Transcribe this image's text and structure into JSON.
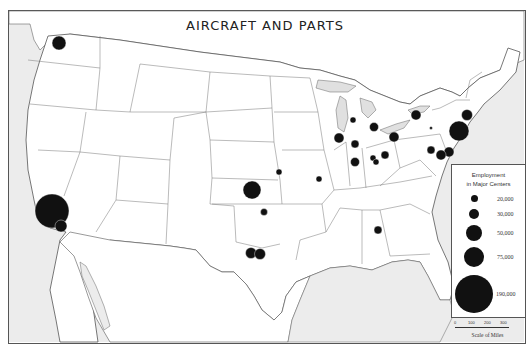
{
  "title": "AIRCRAFT AND PARTS",
  "legend": {
    "title_line1": "Employment",
    "title_line2": "in Major Centers",
    "items": [
      {
        "label": "20,000",
        "r": 3.5
      },
      {
        "label": "30,000",
        "r": 5
      },
      {
        "label": "50,000",
        "r": 8
      },
      {
        "label": "75,000",
        "r": 10
      },
      {
        "label": "190,000",
        "r": 19
      }
    ]
  },
  "scale": {
    "ticks": [
      "0",
      "100",
      "200",
      "300"
    ],
    "label": "Scale of Miles"
  },
  "centers": [
    {
      "name": "Seattle",
      "x": 59,
      "y": 43,
      "r": 7
    },
    {
      "name": "Los Angeles",
      "x": 52,
      "y": 211,
      "r": 17
    },
    {
      "name": "San Diego",
      "x": 61,
      "y": 226,
      "r": 6
    },
    {
      "name": "Wichita",
      "x": 252,
      "y": 190,
      "r": 9
    },
    {
      "name": "Kansas City",
      "x": 279,
      "y": 172,
      "r": 3
    },
    {
      "name": "St. Louis",
      "x": 319,
      "y": 179,
      "r": 3
    },
    {
      "name": "Tulsa",
      "x": 264,
      "y": 212,
      "r": 3.5
    },
    {
      "name": "Dallas",
      "x": 251,
      "y": 253,
      "r": 5.5
    },
    {
      "name": "Fort Worth",
      "x": 260,
      "y": 254,
      "r": 5.5
    },
    {
      "name": "Marietta",
      "x": 378,
      "y": 230,
      "r": 4
    },
    {
      "name": "Chicago",
      "x": 339,
      "y": 138,
      "r": 5
    },
    {
      "name": "Milwaukee",
      "x": 353,
      "y": 120,
      "r": 3
    },
    {
      "name": "Detroit",
      "x": 374,
      "y": 127,
      "r": 4.5
    },
    {
      "name": "Indianapolis",
      "x": 355,
      "y": 144,
      "r": 4
    },
    {
      "name": "Evansville",
      "x": 355,
      "y": 162,
      "r": 4.5
    },
    {
      "name": "Dayton",
      "x": 373,
      "y": 158,
      "r": 3
    },
    {
      "name": "Cincinnati",
      "x": 376,
      "y": 162,
      "r": 3
    },
    {
      "name": "Columbus",
      "x": 385,
      "y": 155,
      "r": 4
    },
    {
      "name": "Cleveland",
      "x": 394,
      "y": 137,
      "r": 5
    },
    {
      "name": "Buffalo",
      "x": 416,
      "y": 115,
      "r": 5
    },
    {
      "name": "Central PA",
      "x": 431,
      "y": 128,
      "r": 1.5
    },
    {
      "name": "New York",
      "x": 459,
      "y": 131,
      "r": 10
    },
    {
      "name": "Hartford",
      "x": 467,
      "y": 115,
      "r": 5.5
    },
    {
      "name": "Philadelphia",
      "x": 449,
      "y": 152,
      "r": 5
    },
    {
      "name": "Baltimore",
      "x": 441,
      "y": 155,
      "r": 5
    },
    {
      "name": "Washington area",
      "x": 431,
      "y": 150,
      "r": 4
    }
  ],
  "colors": {
    "land": "#ffffff",
    "water": "#e6e6e6",
    "border": "#555555",
    "marker": "#111111"
  }
}
